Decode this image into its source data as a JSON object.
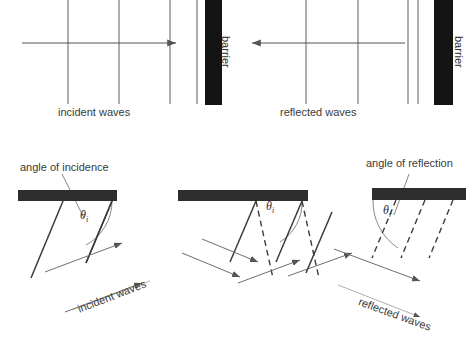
{
  "figure": {
    "stroke_color": "#555555",
    "barrier_color": "#1a1a1a",
    "text_color": "#3a3a3a",
    "background": "#ffffff"
  },
  "top_panels": {
    "left": {
      "caption": "incident waves",
      "barrier_label": "barrier",
      "direction": "right",
      "wavefront_count": 4
    },
    "right": {
      "caption": "reflected waves",
      "barrier_label": "barrier",
      "direction": "left",
      "wavefront_count": 4
    }
  },
  "bottom_panels": {
    "left": {
      "annotation": "angle of incidence",
      "angle_symbol": "θ",
      "angle_subscript": "i",
      "wave_label": "incident waves",
      "wavefront_style": "solid"
    },
    "middle": {
      "angle_symbol": "θ",
      "angle_subscript": "i",
      "wavefront_style": "solid-and-dashed"
    },
    "right": {
      "annotation": "angle of reflection",
      "angle_symbol": "θ",
      "angle_subscript": "r",
      "wave_label": "reflected waves",
      "wavefront_style": "dashed"
    }
  }
}
